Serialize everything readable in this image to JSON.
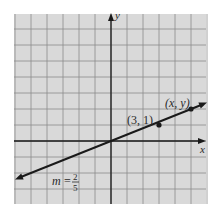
{
  "chart_data": {
    "type": "line",
    "title": "",
    "xlabel": "x",
    "ylabel": "y",
    "xlim": [
      -6,
      6
    ],
    "ylim": [
      -4,
      8
    ],
    "grid": true,
    "series": [
      {
        "name": "line through origin",
        "slope_label": "m = 2/5",
        "slope": 0.4,
        "x": [
          -6,
          0,
          3,
          5,
          6
        ],
        "y": [
          -2.4,
          0,
          1,
          2,
          2.4
        ]
      }
    ],
    "points": [
      {
        "label": "(3, 1)",
        "x": 3,
        "y": 1
      },
      {
        "label": "(x, y)",
        "x": 5,
        "y": 2
      }
    ],
    "annotations": {
      "slope": {
        "m": "m",
        "eq": "=",
        "num": "2",
        "den": "5"
      }
    }
  },
  "colors": {
    "panel": "#d9d9d9",
    "grid": "#8a8a8a",
    "axis": "#1a1a1a",
    "line": "#1a1a1a"
  }
}
